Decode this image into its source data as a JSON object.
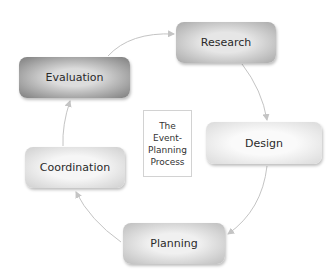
{
  "diagram": {
    "title_lines": [
      "The",
      "Event-",
      "Planning",
      "Process"
    ],
    "nodes": [
      {
        "id": "research",
        "label": "Research",
        "shade": "#a9a9a9"
      },
      {
        "id": "design",
        "label": "Design",
        "shade": "#dadada"
      },
      {
        "id": "planning",
        "label": "Planning",
        "shade": "#bdbdbd"
      },
      {
        "id": "coordination",
        "label": "Coordination",
        "shade": "#cfcfcf"
      },
      {
        "id": "evaluation",
        "label": "Evaluation",
        "shade": "#7d7d7d"
      }
    ],
    "edges": [
      {
        "from": "research",
        "to": "design"
      },
      {
        "from": "design",
        "to": "planning"
      },
      {
        "from": "planning",
        "to": "coordination"
      },
      {
        "from": "coordination",
        "to": "evaluation"
      },
      {
        "from": "evaluation",
        "to": "research"
      }
    ],
    "arrow_color": "#c4c4c4"
  }
}
